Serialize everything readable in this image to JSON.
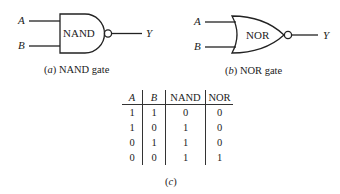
{
  "nand_gate": {
    "body_label": "NAND",
    "input_a": "A",
    "input_b": "B",
    "output": "Y",
    "caption_letter": "(a)",
    "caption_text": "NAND gate"
  },
  "nor_gate": {
    "body_label": "NOR",
    "input_a": "A",
    "input_b": "B",
    "output": "Y",
    "caption_letter": "(b)",
    "caption_text": "NOR gate"
  },
  "truth_table": {
    "headers": [
      "A",
      "B",
      "NAND",
      "NOR"
    ],
    "rows": [
      [
        "1",
        "1",
        "0",
        "0"
      ],
      [
        "1",
        "0",
        "1",
        "0"
      ],
      [
        "0",
        "1",
        "1",
        "0"
      ],
      [
        "0",
        "0",
        "1",
        "1"
      ]
    ],
    "caption": "(c)"
  }
}
